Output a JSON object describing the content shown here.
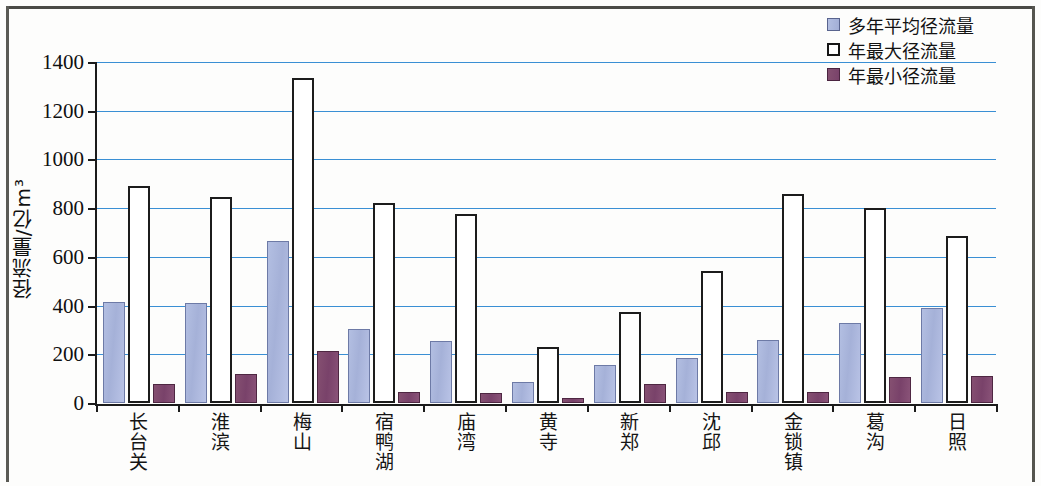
{
  "chart_data": {
    "type": "bar",
    "title": "",
    "xlabel": "",
    "ylabel": "径流量/亿m³",
    "ylim": [
      0,
      1400
    ],
    "ytick_values": [
      0,
      200,
      400,
      600,
      800,
      1000,
      1200,
      1400
    ],
    "ytick_labels": [
      "0",
      "200",
      "400",
      "600",
      "800",
      "1000",
      "1200",
      "1400"
    ],
    "grid": true,
    "grid_color": "#3a8fd4",
    "legend_position": "top-right",
    "categories": [
      "长台关",
      "淮滨",
      "梅山",
      "宿鸭湖",
      "庙湾",
      "黄寺",
      "新郑",
      "沈邱",
      "金锁镇",
      "葛沟",
      "日照"
    ],
    "series": [
      {
        "name": "多年平均径流量",
        "color": "#a8b4dc",
        "values": [
          415,
          410,
          665,
          305,
          255,
          85,
          155,
          185,
          260,
          330,
          390
        ]
      },
      {
        "name": "年最大径流量",
        "color": "#ffffff",
        "values": [
          890,
          845,
          1335,
          820,
          775,
          230,
          375,
          540,
          860,
          800,
          685
        ]
      },
      {
        "name": "年最小径流量",
        "color": "#7d4668",
        "values": [
          80,
          120,
          215,
          45,
          40,
          20,
          80,
          45,
          45,
          105,
          110
        ]
      }
    ]
  },
  "legend": {
    "items": [
      {
        "label": "多年平均径流量"
      },
      {
        "label": "年最大径流量"
      },
      {
        "label": "年最小径流量"
      }
    ]
  },
  "axis": {
    "y_title": "径流量/亿m³"
  }
}
